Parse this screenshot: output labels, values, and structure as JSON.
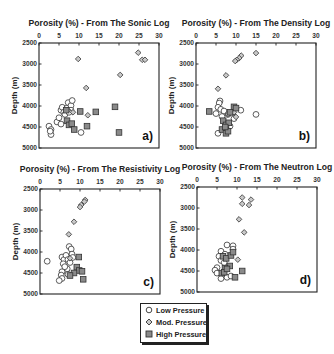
{
  "chart_data": [
    {
      "id": "a",
      "type": "scatter",
      "title": "Porosity (%) - From The Sonic Log",
      "xlabel": "Porosity (%)",
      "ylabel": "Depth (m)",
      "panel_label": "a)",
      "xlim": [
        0,
        30
      ],
      "ylim": [
        5000,
        2500
      ],
      "x_ticks": [
        0,
        5,
        10,
        15,
        20,
        25,
        30
      ],
      "y_ticks": [
        2500,
        3000,
        3500,
        4000,
        4500,
        5000
      ],
      "x_axis_position": "top",
      "grid": false,
      "series": [
        {
          "name": "Low Pressure",
          "marker": "circle",
          "points": [
            [
              2.5,
              4480
            ],
            [
              3,
              4560
            ],
            [
              3,
              4680
            ],
            [
              2.8,
              4600
            ],
            [
              4.5,
              4380
            ],
            [
              5,
              4280
            ],
            [
              5.5,
              4430
            ],
            [
              5.5,
              4100
            ],
            [
              5.8,
              4030
            ],
            [
              6.2,
              4150
            ],
            [
              6.5,
              4200
            ],
            [
              7,
              4050
            ],
            [
              7.3,
              3920
            ],
            [
              8,
              3990
            ],
            [
              8.3,
              3870
            ],
            [
              8,
              4100
            ],
            [
              7.5,
              4150
            ],
            [
              10.5,
              4630
            ]
          ]
        },
        {
          "name": "Mod. Pressure",
          "marker": "diamond",
          "points": [
            [
              9.8,
              2880
            ],
            [
              11.8,
              3570
            ],
            [
              20.3,
              3260
            ],
            [
              24.8,
              2730
            ],
            [
              25.8,
              2900
            ],
            [
              26.5,
              2900
            ],
            [
              12.2,
              4220
            ],
            [
              7.2,
              4100
            ],
            [
              8.5,
              4150
            ]
          ]
        },
        {
          "name": "High Pressure",
          "marker": "square",
          "points": [
            [
              6.8,
              4100
            ],
            [
              7,
              4350
            ],
            [
              7.5,
              4450
            ],
            [
              8.2,
              4420
            ],
            [
              8.8,
              4560
            ],
            [
              10.3,
              4130
            ],
            [
              12,
              4480
            ],
            [
              14.2,
              4140
            ],
            [
              19,
              4020
            ],
            [
              20,
              4630
            ]
          ]
        }
      ]
    },
    {
      "id": "b",
      "type": "scatter",
      "title": "Porosity (%) - From The Density Log",
      "xlabel": "Porosity (%)",
      "ylabel": "Depth (m)",
      "panel_label": "b)",
      "xlim": [
        0,
        30
      ],
      "ylim": [
        5000,
        2500
      ],
      "x_ticks": [
        0,
        5,
        10,
        15,
        20,
        25,
        30
      ],
      "y_ticks": [
        2500,
        3000,
        3500,
        4000,
        4500,
        5000
      ],
      "x_axis_position": "top",
      "grid": false,
      "series": [
        {
          "name": "Low Pressure",
          "marker": "circle",
          "points": [
            [
              6,
              3880
            ],
            [
              5.8,
              3930
            ],
            [
              5.5,
              4030
            ],
            [
              6.2,
              4080
            ],
            [
              5,
              4180
            ],
            [
              7,
              4120
            ],
            [
              6.5,
              4250
            ],
            [
              8,
              4200
            ],
            [
              9.2,
              4150
            ],
            [
              9.5,
              4300
            ],
            [
              11.2,
              4100
            ],
            [
              15,
              4200
            ],
            [
              5.5,
              4650
            ],
            [
              7.2,
              4560
            ],
            [
              8.5,
              4480
            ]
          ]
        },
        {
          "name": "Mod. Pressure",
          "marker": "diamond",
          "points": [
            [
              15,
              2740
            ],
            [
              11.3,
              2800
            ],
            [
              10.8,
              2860
            ],
            [
              10.2,
              2900
            ],
            [
              9.8,
              2930
            ],
            [
              7.5,
              3270
            ],
            [
              5.5,
              3590
            ],
            [
              8,
              4200
            ],
            [
              10,
              4260
            ],
            [
              9.5,
              4150
            ]
          ]
        },
        {
          "name": "High Pressure",
          "marker": "square",
          "points": [
            [
              3.3,
              4130
            ],
            [
              6.8,
              4350
            ],
            [
              7.5,
              4450
            ],
            [
              8.2,
              4400
            ],
            [
              6.5,
              4560
            ],
            [
              7.5,
              4650
            ],
            [
              8,
              4600
            ],
            [
              9.5,
              4020
            ],
            [
              10,
              4050
            ],
            [
              8.5,
              4150
            ],
            [
              7.3,
              4500
            ]
          ]
        }
      ]
    },
    {
      "id": "c",
      "type": "scatter",
      "title": "Porosity (%) - From The Resistivity Log",
      "xlabel": "Porosity (%)",
      "ylabel": "Depth (m)",
      "panel_label": "c)",
      "xlim": [
        0,
        30
      ],
      "ylim": [
        5000,
        2500
      ],
      "x_ticks": [
        0,
        5,
        10,
        15,
        20,
        25,
        30
      ],
      "y_ticks": [
        2500,
        3000,
        3500,
        4000,
        4500,
        5000
      ],
      "x_axis_position": "top",
      "grid": false,
      "series": [
        {
          "name": "Low Pressure",
          "marker": "circle",
          "points": [
            [
              1.8,
              4220
            ],
            [
              5.5,
              4120
            ],
            [
              6,
              4180
            ],
            [
              5.8,
              4280
            ],
            [
              6.5,
              4080
            ],
            [
              7,
              4180
            ],
            [
              7.3,
              3870
            ],
            [
              7.8,
              3930
            ],
            [
              8,
              4050
            ],
            [
              7.5,
              4250
            ],
            [
              6.8,
              4400
            ],
            [
              5.5,
              4470
            ],
            [
              5.3,
              4550
            ],
            [
              5.5,
              4630
            ],
            [
              4.8,
              4680
            ],
            [
              7,
              4530
            ],
            [
              6.2,
              4350
            ],
            [
              8.2,
              4130
            ]
          ]
        },
        {
          "name": "Mod. Pressure",
          "marker": "diamond",
          "points": [
            [
              11.3,
              2760
            ],
            [
              11.1,
              2800
            ],
            [
              10.3,
              2880
            ],
            [
              10,
              2930
            ],
            [
              8.5,
              3280
            ],
            [
              7.2,
              3580
            ],
            [
              7.5,
              4150
            ]
          ]
        },
        {
          "name": "High Pressure",
          "marker": "square",
          "points": [
            [
              9.7,
              4120
            ],
            [
              9.2,
              4360
            ],
            [
              9.8,
              4440
            ],
            [
              10.5,
              4460
            ],
            [
              8.5,
              4500
            ],
            [
              7.5,
              4560
            ],
            [
              10.8,
              4650
            ]
          ]
        }
      ]
    },
    {
      "id": "d",
      "type": "scatter",
      "title": "Porosity (%) - From The Neutron Log",
      "xlabel": "Porosity (%)",
      "ylabel": "Depth (m)",
      "panel_label": "d)",
      "xlim": [
        0,
        30
      ],
      "ylim": [
        5000,
        2500
      ],
      "x_ticks": [
        0,
        5,
        10,
        15,
        20,
        25,
        30
      ],
      "y_ticks": [
        2500,
        3000,
        3500,
        4000,
        4500,
        5000
      ],
      "x_axis_position": "top",
      "grid": false,
      "series": [
        {
          "name": "Low Pressure",
          "marker": "circle",
          "points": [
            [
              7.5,
              3880
            ],
            [
              9,
              3900
            ],
            [
              6,
              4030
            ],
            [
              7,
              4100
            ],
            [
              5.5,
              4150
            ],
            [
              6,
              4250
            ],
            [
              6.8,
              4300
            ],
            [
              5,
              4420
            ],
            [
              4.5,
              4480
            ],
            [
              5,
              4550
            ],
            [
              6,
              4680
            ],
            [
              7.5,
              4650
            ],
            [
              8.5,
              4620
            ],
            [
              9,
              3980
            ]
          ]
        },
        {
          "name": "Mod. Pressure",
          "marker": "diamond",
          "points": [
            [
              11.3,
              2750
            ],
            [
              13.5,
              2800
            ],
            [
              11.3,
              2900
            ],
            [
              13,
              2930
            ],
            [
              10.5,
              3270
            ],
            [
              11.8,
              3580
            ],
            [
              10.2,
              4230
            ],
            [
              6.5,
              4130
            ]
          ]
        },
        {
          "name": "High Pressure",
          "marker": "square",
          "points": [
            [
              6.5,
              4150
            ],
            [
              7.3,
              4200
            ],
            [
              8.5,
              4130
            ],
            [
              9,
              4050
            ],
            [
              8.2,
              4380
            ],
            [
              7,
              4430
            ],
            [
              6.2,
              4550
            ],
            [
              6.8,
              4530
            ],
            [
              9.5,
              4650
            ],
            [
              11.3,
              4500
            ],
            [
              7.5,
              4450
            ]
          ]
        }
      ]
    }
  ],
  "legend": {
    "entries": [
      {
        "label": "Low Pressure",
        "marker": "circle"
      },
      {
        "label": "Mod. Pressure",
        "marker": "diamond"
      },
      {
        "label": "High Pressure",
        "marker": "square"
      }
    ]
  },
  "colors": {
    "axis": "#222222",
    "low_fill": "#ffffff",
    "mod_fill": "#c8c8c8",
    "high_fill": "#8a8a8a",
    "marker_stroke": "#333333"
  }
}
